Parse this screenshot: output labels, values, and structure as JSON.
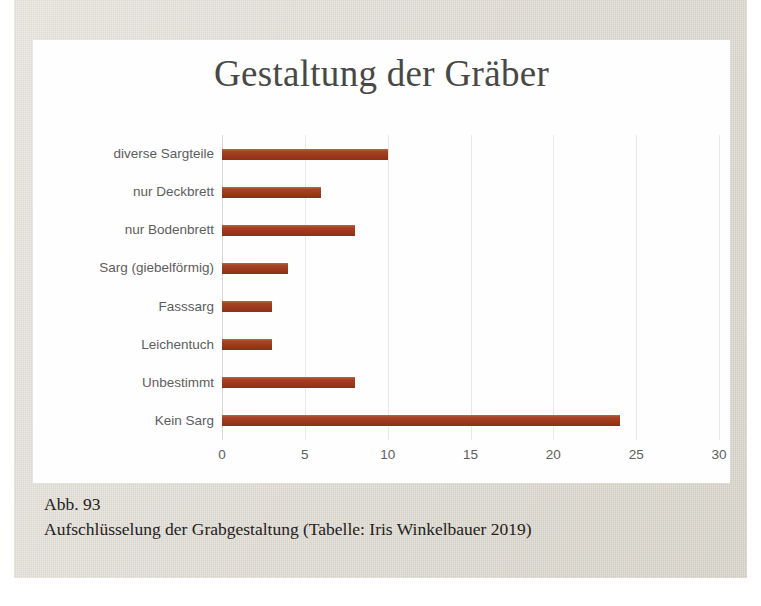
{
  "page": {
    "background_color": "#d9d5c9",
    "panel_color": "#fefefe"
  },
  "figure": {
    "caption_number": "Abb. 93",
    "caption_text": "Aufschlüsselung der Grabgestaltung (Tabelle: Iris Winkelbauer 2019)"
  },
  "chart_data": {
    "type": "bar",
    "orientation": "horizontal",
    "title": "Gestaltung der Gräber",
    "xlabel": "",
    "ylabel": "",
    "categories": [
      "diverse Sargteile",
      "nur Deckbrett",
      "nur Bodenbrett",
      "Sarg (giebelförmig)",
      "Fasssarg",
      "Leichentuch",
      "Unbestimmt",
      "Kein Sarg"
    ],
    "values": [
      10,
      6,
      8,
      4,
      3,
      3,
      8,
      24
    ],
    "xlim": [
      0,
      30
    ],
    "xticks": [
      0,
      5,
      10,
      15,
      20,
      25,
      30
    ],
    "xtick_labels": [
      "0",
      "5",
      "10",
      "15",
      "20",
      "25",
      "30"
    ],
    "grid": true,
    "grid_axis": "x",
    "legend": false,
    "bar_color": "#a33919",
    "title_color": "#484846",
    "tick_label_color": "#5d5d5d",
    "gridline_color": "#e9e8e4"
  }
}
